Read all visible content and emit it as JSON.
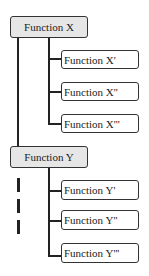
{
  "diagram": {
    "groups": [
      {
        "parent": "Function X",
        "children": [
          "Function X'",
          "Function X''",
          "Function X'''"
        ]
      },
      {
        "parent": "Function Y",
        "children": [
          "Function Y'",
          "Function Y''",
          "Function Y'''"
        ]
      }
    ],
    "colors": {
      "parent_fill": "#e6e6e6",
      "child_fill": "#ffffff",
      "stroke": "#222222"
    }
  }
}
